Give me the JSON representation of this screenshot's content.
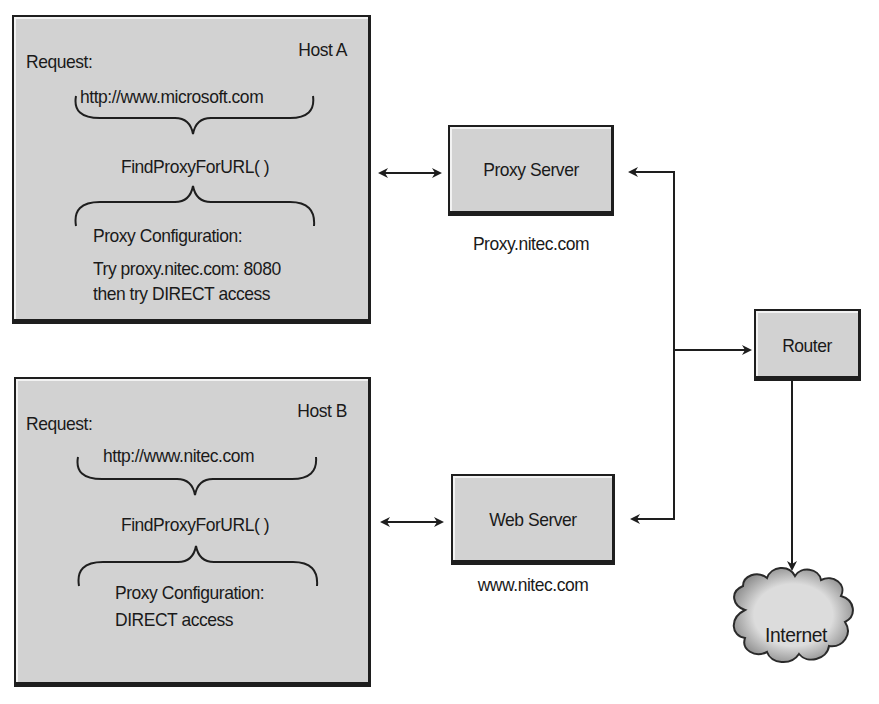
{
  "hosts": [
    {
      "name": "Host A",
      "request_label": "Request:",
      "url": "http://www.microsoft.com",
      "function": "FindProxyForURL( )",
      "config_label": "Proxy Configuration:",
      "config_lines": [
        "Try proxy.nitec.com: 8080",
        "then try DIRECT access"
      ]
    },
    {
      "name": "Host B",
      "request_label": "Request:",
      "url": "http://www.nitec.com",
      "function": "FindProxyForURL( )",
      "config_label": "Proxy Configuration:",
      "config_lines": [
        "DIRECT access"
      ]
    }
  ],
  "servers": [
    {
      "label": "Proxy Server",
      "hostname": "Proxy.nitec.com"
    },
    {
      "label": "Web Server",
      "hostname": "www.nitec.com"
    }
  ],
  "router": {
    "label": "Router"
  },
  "internet": {
    "label": "Internet"
  },
  "colors": {
    "box_fill": "#d2d2d2",
    "border": "#1e1e1e",
    "line": "#1e1e1e",
    "background": "#ffffff"
  }
}
